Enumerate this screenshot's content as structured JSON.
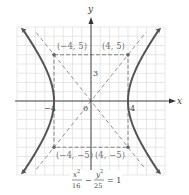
{
  "diagram": {
    "type": "hyperbola-graph",
    "equation": {
      "x_term_num": "x",
      "x_term_exp": "2",
      "x_term_den": "16",
      "minus": "−",
      "y_term_num": "y",
      "y_term_exp": "2",
      "y_term_den": "25",
      "rhs": "= 1"
    },
    "a_squared": 16,
    "b_squared": 25,
    "orientation": "horizontal",
    "axes": {
      "x_label": "x",
      "y_label": "y",
      "range": [
        -8,
        8
      ],
      "ticks": {
        "x_neg": "−4",
        "x_pos": "4",
        "origin": "0",
        "y": "3"
      }
    },
    "asymptote_slope": 1.25,
    "points": [
      {
        "label": "(−4, 5)",
        "x": -4,
        "y": 5
      },
      {
        "label": "(4, 5)",
        "x": 4,
        "y": 5
      },
      {
        "label": "(−4, −5)",
        "x": -4,
        "y": -5
      },
      {
        "label": "(4, −5)",
        "x": 4,
        "y": -5
      }
    ],
    "colors": {
      "curve": "#555555",
      "grid": "#d8d8d8",
      "dashed": "#777777"
    }
  }
}
